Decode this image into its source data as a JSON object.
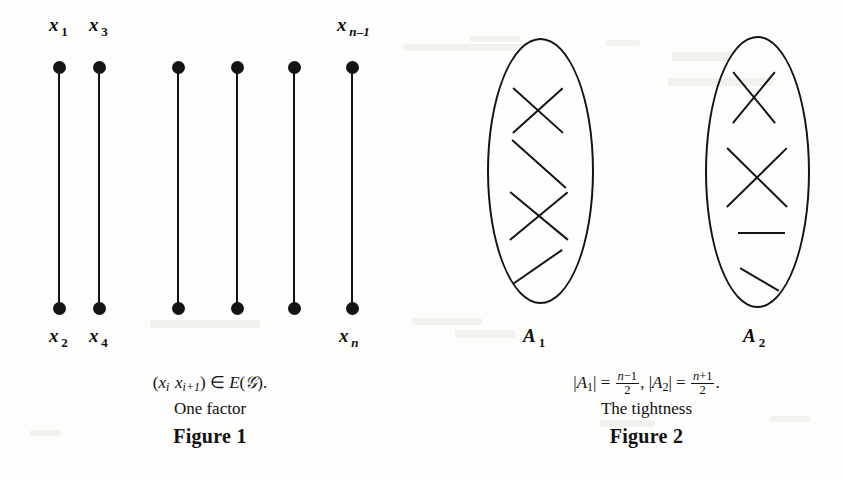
{
  "page": {
    "background_color": "#fdfdfb",
    "ink_color": "#141414",
    "kind": "scanned-mathematical-figure-pair"
  },
  "figure1": {
    "title": "Figure 1",
    "subtitle": "One factor",
    "formula_parts": {
      "open": "(",
      "x1": "x",
      "x1_sub": "i",
      "x2": "x",
      "x2_sub": "i+1",
      "close": ")",
      "member": "∈",
      "edgeset": "E",
      "paren_open": "(",
      "graph": "𝒢",
      "paren_close": ")",
      "period": "."
    },
    "formula_plain": "(x_i x_{i+1}) ∈ E(𝒢).",
    "top_labels": [
      {
        "base": "x",
        "sub": "1",
        "sub_style": "num",
        "x": 49,
        "y": 14
      },
      {
        "base": "x",
        "sub": "3",
        "sub_style": "num",
        "x": 89,
        "y": 14
      },
      {
        "base": "x",
        "sub": "n–1",
        "sub_style": "ital",
        "x": 337,
        "y": 14
      }
    ],
    "bottom_labels": [
      {
        "base": "x",
        "sub": "2",
        "sub_style": "num",
        "x": 49,
        "y": 325
      },
      {
        "base": "x",
        "sub": "4",
        "sub_style": "num",
        "x": 89,
        "y": 325
      },
      {
        "base": "x",
        "sub": "n",
        "sub_style": "ital",
        "x": 339,
        "y": 325
      }
    ],
    "edges": [
      {
        "x": 59,
        "top": 68,
        "bottom": 308
      },
      {
        "x": 99,
        "top": 68,
        "bottom": 308
      },
      {
        "x": 178,
        "top": 68,
        "bottom": 308
      },
      {
        "x": 237,
        "top": 68,
        "bottom": 308
      },
      {
        "x": 294,
        "top": 68,
        "bottom": 308
      },
      {
        "x": 352,
        "top": 68,
        "bottom": 308
      }
    ],
    "node_count": 12
  },
  "figure2": {
    "title": "Figure 2",
    "subtitle": "The tightness",
    "formula_plain": "|A₁| = (n−1)/2, |A₂| = (n+1)/2.",
    "formula_parts": {
      "abs1_open": "|",
      "a1": "A",
      "a1_sub": "1",
      "abs1_close": "|",
      "eq1": "=",
      "f1_num_n": "n",
      "f1_num_op": "−1",
      "f1_den": "2",
      "comma": ",",
      "abs2_open": "|",
      "a2": "A",
      "a2_sub": "2",
      "abs2_close": "|",
      "eq2": "=",
      "f2_num_n": "n",
      "f2_num_op": "+1",
      "f2_den": "2",
      "period": "."
    },
    "sets": [
      {
        "name": "A",
        "subscript": "1",
        "label_x": 523,
        "label_y": 325,
        "ellipse": {
          "left": 487,
          "top": 38,
          "width": 103,
          "height": 262
        },
        "segments": [
          {
            "x1": 513,
            "y1": 88,
            "x2": 563,
            "y2": 133,
            "kind": "cross-a"
          },
          {
            "x1": 513,
            "y1": 133,
            "x2": 563,
            "y2": 88,
            "kind": "cross-b"
          },
          {
            "x1": 512,
            "y1": 140,
            "x2": 566,
            "y2": 188,
            "kind": "diagonal-down"
          },
          {
            "x1": 510,
            "y1": 192,
            "x2": 568,
            "y2": 240,
            "kind": "cross-a"
          },
          {
            "x1": 510,
            "y1": 240,
            "x2": 568,
            "y2": 192,
            "kind": "cross-b"
          },
          {
            "x1": 513,
            "y1": 284,
            "x2": 562,
            "y2": 250,
            "kind": "diagonal-up"
          }
        ]
      },
      {
        "name": "A",
        "subscript": "2",
        "label_x": 743,
        "label_y": 325,
        "ellipse": {
          "left": 705,
          "top": 36,
          "width": 101,
          "height": 268
        },
        "segments": [
          {
            "x1": 733,
            "y1": 72,
            "x2": 775,
            "y2": 123,
            "kind": "cross-a"
          },
          {
            "x1": 733,
            "y1": 123,
            "x2": 775,
            "y2": 72,
            "kind": "cross-b"
          },
          {
            "x1": 727,
            "y1": 148,
            "x2": 787,
            "y2": 207,
            "kind": "cross-a"
          },
          {
            "x1": 727,
            "y1": 207,
            "x2": 787,
            "y2": 148,
            "kind": "cross-b"
          },
          {
            "x1": 738,
            "y1": 233,
            "x2": 785,
            "y2": 233,
            "kind": "horizontal"
          },
          {
            "x1": 740,
            "y1": 268,
            "x2": 779,
            "y2": 291,
            "kind": "diagonal-down"
          }
        ]
      }
    ]
  },
  "scan_artifacts": [
    {
      "x": 404,
      "y": 44,
      "w": 120,
      "h": 7
    },
    {
      "x": 470,
      "y": 36,
      "w": 50,
      "h": 6
    },
    {
      "x": 606,
      "y": 40,
      "w": 34,
      "h": 6
    },
    {
      "x": 672,
      "y": 52,
      "w": 60,
      "h": 9
    },
    {
      "x": 668,
      "y": 78,
      "w": 105,
      "h": 8
    },
    {
      "x": 150,
      "y": 320,
      "w": 110,
      "h": 8
    },
    {
      "x": 412,
      "y": 318,
      "w": 70,
      "h": 7
    },
    {
      "x": 455,
      "y": 330,
      "w": 60,
      "h": 8
    },
    {
      "x": 600,
      "y": 420,
      "w": 55,
      "h": 7
    },
    {
      "x": 770,
      "y": 416,
      "w": 40,
      "h": 6
    },
    {
      "x": 30,
      "y": 430,
      "w": 30,
      "h": 6
    }
  ]
}
